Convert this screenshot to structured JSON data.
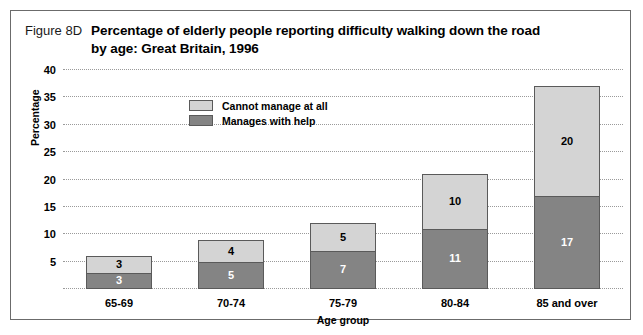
{
  "figure": {
    "number": "Figure 8D",
    "title_line1": "Percentage of elderly people reporting difficulty walking down the road",
    "title_line2": "by age: Great Britain, 1996"
  },
  "colors": {
    "cannot_manage": "#d4d4d4",
    "manages_with_help": "#848484",
    "border": "#5a5a5a",
    "gridline": "#9a9a9a",
    "frame": "#6b6b6b"
  },
  "chart_data": {
    "type": "bar",
    "stacked": true,
    "title": "Percentage of elderly people reporting difficulty walking down the road by age: Great Britain, 1996",
    "xlabel": "Age group",
    "ylabel": "Percentage",
    "categories": [
      "65-69",
      "70-74",
      "75-79",
      "80-84",
      "85 and over"
    ],
    "series": [
      {
        "name": "Manages with help",
        "values": [
          3,
          5,
          7,
          11,
          17
        ],
        "color": "#848484"
      },
      {
        "name": "Cannot manage at all",
        "values": [
          3,
          4,
          5,
          10,
          20
        ],
        "color": "#d4d4d4"
      }
    ],
    "totals": [
      6,
      9,
      12,
      21,
      37
    ],
    "ylim": [
      0,
      40
    ],
    "yticks": [
      5,
      10,
      15,
      20,
      25,
      30,
      35,
      40
    ],
    "grid": true,
    "legend_position": "inside-top-left"
  }
}
